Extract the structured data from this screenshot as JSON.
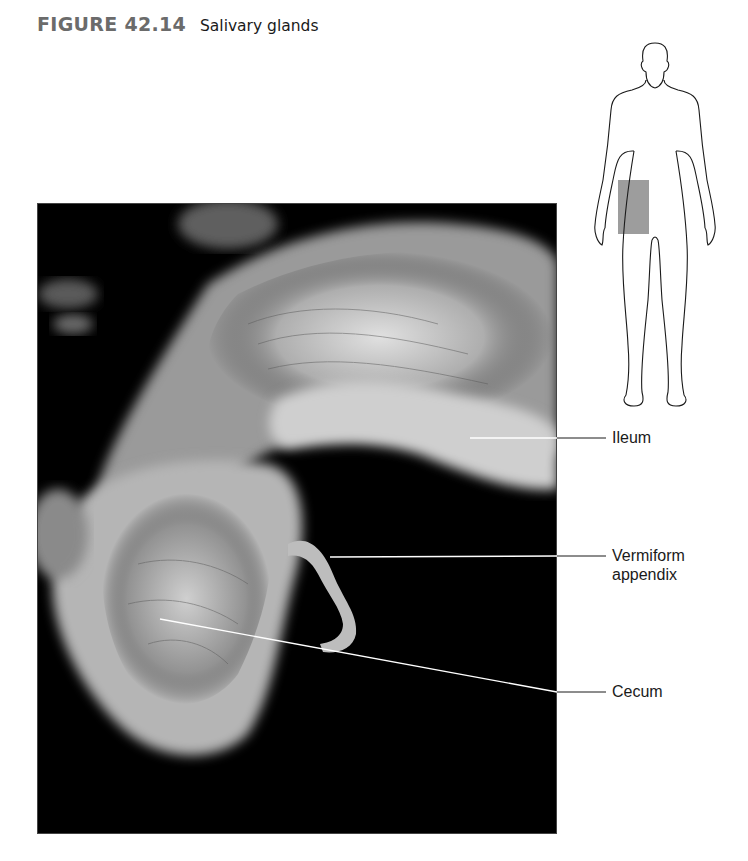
{
  "figure": {
    "number": "FIGURE 42.14",
    "caption": "Salivary glands"
  },
  "orientation_diagram": {
    "description": "Human body outline with highlighted region",
    "highlight_color": "#8c8c8c"
  },
  "photo": {
    "description": "Cadaver dissection photograph of ileocecal region"
  },
  "labels": [
    {
      "id": "ileum",
      "lines": [
        "Ileum"
      ]
    },
    {
      "id": "vermiform-appendix",
      "lines": [
        "Vermiform",
        "appendix"
      ]
    },
    {
      "id": "cecum",
      "lines": [
        "Cecum"
      ]
    }
  ]
}
